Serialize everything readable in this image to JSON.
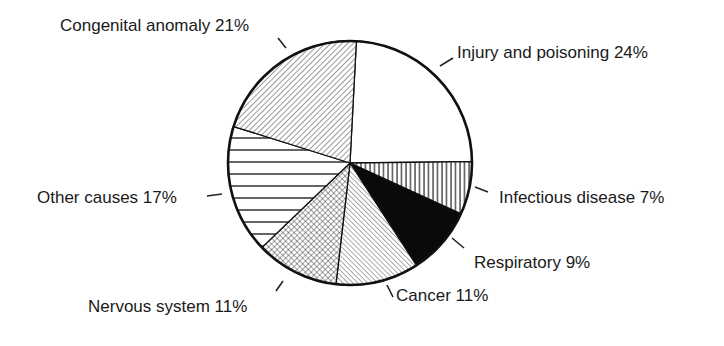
{
  "chart_data": {
    "type": "pie",
    "title": "",
    "start_angle_deg": -87,
    "direction": "clockwise",
    "slices": [
      {
        "label": "Injury and poisoning",
        "value": 24,
        "display": "Injury and poisoning 24%",
        "pattern": "none"
      },
      {
        "label": "Infectious disease",
        "value": 7,
        "display": "Infectious disease 7%",
        "pattern": "vertical-lines"
      },
      {
        "label": "Respiratory",
        "value": 9,
        "display": "Respiratory 9%",
        "pattern": "solid-black"
      },
      {
        "label": "Cancer",
        "value": 11,
        "display": "Cancer 11%",
        "pattern": "diagonal-fine"
      },
      {
        "label": "Nervous system",
        "value": 11,
        "display": "Nervous system 11%",
        "pattern": "crosshatch"
      },
      {
        "label": "Other causes",
        "value": 17,
        "display": "Other causes 17%",
        "pattern": "horizontal-lines"
      },
      {
        "label": "Congenital anomaly",
        "value": 21,
        "display": "Congenital anomaly 21%",
        "pattern": "diagonal-backslash"
      }
    ],
    "unit": "%",
    "legend": "none (direct labels with leader lines)"
  },
  "labels": {
    "injury": "Injury and poisoning 24%",
    "infectious": "Infectious disease 7%",
    "respiratory": "Respiratory 9%",
    "cancer": "Cancer 11%",
    "nervous": "Nervous system 11%",
    "other": "Other causes 17%",
    "congenital": "Congenital anomaly 21%"
  },
  "colors": {
    "outline": "#111111",
    "fill_solid": "#0a0a0a",
    "background": "#ffffff",
    "text": "#1a1a1a"
  }
}
